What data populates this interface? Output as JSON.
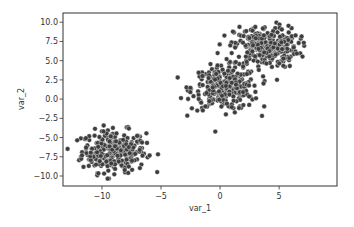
{
  "chart_data": {
    "type": "scatter",
    "title": "",
    "xlabel": "var_1",
    "ylabel": "var_2",
    "xlim": [
      -13.3,
      9.9
    ],
    "ylim": [
      -11.3,
      11.2
    ],
    "xticks": [
      -10,
      -5,
      0,
      5
    ],
    "xtick_labels": [
      "−10",
      "−5",
      "0",
      "5"
    ],
    "yticks": [
      -10,
      -7.5,
      -5,
      -2.5,
      0,
      2.5,
      5,
      7.5,
      10
    ],
    "ytick_labels": [
      "−10.0",
      "−7.5",
      "−5.0",
      "−2.5",
      "0.0",
      "2.5",
      "5.0",
      "7.5",
      "10.0"
    ],
    "grid": false,
    "legend": null,
    "marker_color": "#3d3d3d",
    "marker_edge_color": "#ffffff",
    "clusters": [
      {
        "name": "cluster_1",
        "center": [
          -9.0,
          -6.8
        ],
        "std": 1.35,
        "n": 300
      },
      {
        "name": "cluster_2",
        "center": [
          0.4,
          1.4
        ],
        "std": 1.4,
        "n": 300
      },
      {
        "name": "cluster_3",
        "center": [
          3.9,
          6.8
        ],
        "std": 1.35,
        "n": 300
      }
    ]
  }
}
